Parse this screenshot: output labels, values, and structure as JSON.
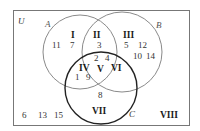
{
  "universe": {
    "label": "U"
  },
  "sets": {
    "A": {
      "label": "A",
      "color": "#888888"
    },
    "B": {
      "label": "B",
      "color": "#888888"
    },
    "C": {
      "label": "C",
      "color": "#222222"
    }
  },
  "regions": {
    "I": {
      "label": "I",
      "elements": [
        "11",
        "7"
      ]
    },
    "II": {
      "label": "II",
      "elements": [
        "3"
      ]
    },
    "III": {
      "label": "III",
      "elements": [
        "5",
        "12",
        "10",
        "14"
      ]
    },
    "IV": {
      "label": "IV",
      "elements": [
        "1",
        "9"
      ]
    },
    "V": {
      "label": "V",
      "elements": [
        "2",
        "4"
      ]
    },
    "VI": {
      "label": "VI",
      "elements": []
    },
    "VII": {
      "label": "VII",
      "elements": [
        "8"
      ]
    },
    "VIII": {
      "label": "VIII",
      "elements": [
        "6",
        "13",
        "15"
      ]
    }
  }
}
